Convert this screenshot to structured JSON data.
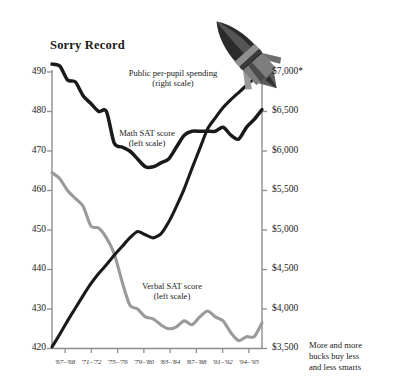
{
  "chart_data": {
    "type": "line",
    "title": "Sorry Record",
    "xlabel": "",
    "ylabel": "",
    "grid": false,
    "legend_position": "inline-annotations",
    "categories": [
      "'67-'68",
      "'71-'72",
      "'75-'76",
      "'79-'80",
      "'83-'84",
      "'87-'88",
      "'91-'92",
      "'94-'95"
    ],
    "x_tick_labels": [
      "'67–'68",
      "'71–'72",
      "'75–'76",
      "'79–'80",
      "'83–'84",
      "'87–'88",
      "'91–'92",
      "'94–'95"
    ],
    "left_axis": {
      "label": "SAT score",
      "ylim": [
        420,
        490
      ],
      "tick_labels": [
        "490",
        "480",
        "470",
        "460",
        "450",
        "440",
        "430",
        "420"
      ],
      "tick_values": [
        490,
        480,
        470,
        460,
        450,
        440,
        430,
        420
      ]
    },
    "right_axis": {
      "label": "Public per-pupil spending",
      "ylim": [
        3500,
        7000
      ],
      "tick_labels": [
        "$7,000*",
        "$6,500",
        "$6,000",
        "$5,500",
        "$5,000",
        "$4,500",
        "$4,000",
        "$3,500"
      ],
      "tick_values": [
        7000,
        6500,
        6000,
        5500,
        5000,
        4500,
        4000,
        3500
      ]
    },
    "series": [
      {
        "name": "Math SAT score",
        "annotation": "Math SAT score\n(left scale)",
        "annotation_line1": "Math SAT score",
        "annotation_line2": "(left scale)",
        "axis": "left",
        "color": "#1a1a1a",
        "x": [
          "'67-'68",
          "'68-'69",
          "'69-'70",
          "'70-'71",
          "'71-'72",
          "'72-'73",
          "'73-'74",
          "'74-'75",
          "'75-'76",
          "'76-'77",
          "'77-'78",
          "'78-'79",
          "'79-'80",
          "'80-'81",
          "'81-'82",
          "'82-'83",
          "'83-'84",
          "'84-'85",
          "'85-'86",
          "'86-'87",
          "'87-'88",
          "'88-'89",
          "'89-'90",
          "'90-'91",
          "'91-'92",
          "'92-'93",
          "'93-'94",
          "'94-'95"
        ],
        "values": [
          492,
          491.5,
          488,
          487.5,
          484,
          482,
          480,
          480,
          472,
          471,
          470,
          468,
          466,
          466,
          467,
          468,
          471,
          474,
          475,
          475,
          475,
          475,
          476,
          474,
          473,
          476,
          478,
          480.5
        ]
      },
      {
        "name": "Verbal SAT score",
        "annotation": "Verbal SAT score\n(left scale)",
        "annotation_line1": "Verbal SAT score",
        "annotation_line2": "(left scale)",
        "axis": "left",
        "color": "#9a9a9a",
        "x": [
          "'67-'68",
          "'68-'69",
          "'69-'70",
          "'70-'71",
          "'71-'72",
          "'72-'73",
          "'73-'74",
          "'74-'75",
          "'75-'76",
          "'76-'77",
          "'77-'78",
          "'78-'79",
          "'79-'80",
          "'80-'81",
          "'81-'82",
          "'82-'83",
          "'83-'84",
          "'84-'85",
          "'85-'86",
          "'86-'87",
          "'87-'88",
          "'88-'89",
          "'89-'90",
          "'90-'91",
          "'91-'92",
          "'92-'93",
          "'93-'94",
          "'94-'95"
        ],
        "values": [
          464.5,
          463,
          460,
          458,
          456,
          451,
          450.5,
          448,
          444,
          437,
          431,
          430,
          428,
          427.5,
          426,
          425,
          425.5,
          427,
          426,
          428,
          429.5,
          428,
          427,
          424,
          422,
          423,
          423,
          426.5
        ]
      },
      {
        "name": "Public per-pupil spending",
        "annotation": "Public per-pupil spending\n(right scale)",
        "annotation_line1": "Public per-pupil spending",
        "annotation_line2": "(right scale)",
        "axis": "right",
        "color": "#1a1a1a",
        "x": [
          "'67-'68",
          "'68-'69",
          "'69-'70",
          "'70-'71",
          "'71-'72",
          "'72-'73",
          "'73-'74",
          "'74-'75",
          "'75-'76",
          "'76-'77",
          "'77-'78",
          "'78-'79",
          "'79-'80",
          "'80-'81",
          "'81-'82",
          "'82-'83",
          "'83-'84",
          "'84-'85",
          "'85-'86",
          "'86-'87",
          "'87-'88",
          "'88-'89",
          "'89-'90",
          "'90-'91",
          "'91-'92",
          "'92-'93",
          "'93-'94",
          "'94-'95"
        ],
        "values": [
          3520,
          3680,
          3850,
          4010,
          4170,
          4320,
          4450,
          4560,
          4680,
          4790,
          4900,
          4980,
          4940,
          4900,
          4950,
          5100,
          5300,
          5520,
          5780,
          6030,
          6280,
          6420,
          6550,
          6650,
          6740,
          6830,
          6920,
          7000
        ]
      }
    ],
    "annotations": [
      {
        "text": "More and more bucks buy less and less smarts",
        "position": "bottom-right"
      }
    ],
    "caption_line1": "More and more",
    "caption_line2": "bucks buy less",
    "caption_line3": "and less smarts",
    "decoration": "rocket"
  }
}
